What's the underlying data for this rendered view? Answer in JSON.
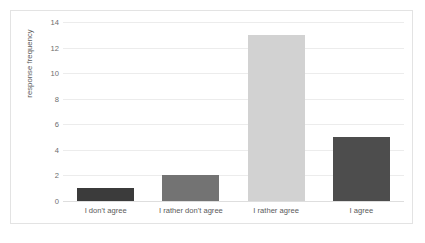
{
  "chart_data": {
    "type": "bar",
    "title": "",
    "subtitle": "",
    "xlabel": "",
    "ylabel": "response frequency",
    "categories": [
      "I don't agree",
      "I rather don't agree",
      "I rather agree",
      "I agree"
    ],
    "values": [
      1,
      2,
      13,
      5
    ],
    "bar_colors": [
      "#3b3b3b",
      "#737373",
      "#d2d2d2",
      "#4d4d4d"
    ],
    "ylim": [
      0,
      14
    ],
    "ytick_labels": [
      "0",
      "2",
      "4",
      "6",
      "8",
      "10",
      "12",
      "14"
    ],
    "ytick_values": [
      0,
      2,
      4,
      6,
      8,
      10,
      12,
      14
    ],
    "grid": true,
    "grid_axis": "y",
    "grid_color": "#ececec",
    "legend": false,
    "legend_position": "none",
    "annotations": [],
    "border_color": "#e3e3e3",
    "background_color": "#ffffff",
    "tick_label_color": "#6e6e6e",
    "axis_title_color": "#5a5a5a"
  }
}
